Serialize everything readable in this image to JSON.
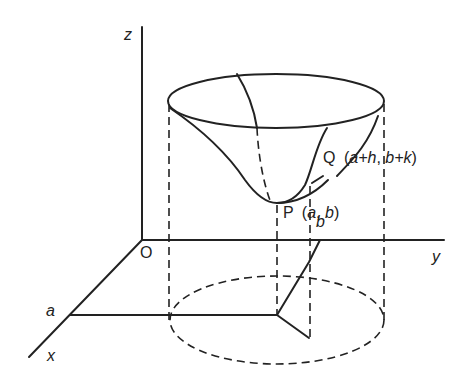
{
  "diagram": {
    "type": "3d-surface-sketch",
    "axes": {
      "z_label": "z",
      "y_label": "y",
      "x_label": "x",
      "origin_label": "O"
    },
    "points": {
      "P": {
        "name": "P",
        "coords": "(a, b)",
        "coord_a": "a",
        "coord_b": "b"
      },
      "Q": {
        "name": "Q",
        "coords": "(a+h, b+k)",
        "part1": "a+h",
        "part2": "b+k"
      }
    },
    "ticks": {
      "x_tick": "a",
      "y_tick": "b"
    },
    "colors": {
      "line": "#222222",
      "background": "#ffffff"
    }
  }
}
